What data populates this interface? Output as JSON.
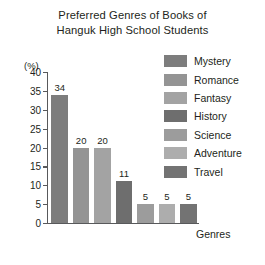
{
  "chart_data": {
    "type": "bar",
    "title": "Preferred Genres of Books of Hanguk High School Students",
    "title_lines": [
      "Preferred Genres of Books of",
      "Hanguk High School Students"
    ],
    "categories": [
      "Mystery",
      "Romance",
      "Fantasy",
      "History",
      "Science",
      "Adventure",
      "Travel"
    ],
    "values": [
      34,
      20,
      20,
      11,
      5,
      5,
      5
    ],
    "xlabel": "Genres",
    "ylabel": "(%)",
    "ylim": [
      0,
      40
    ],
    "ytick_labels": [
      "40",
      "35",
      "30",
      "25",
      "20",
      "15",
      "10",
      "5",
      "0"
    ],
    "ytick_values": [
      40,
      35,
      30,
      25,
      20,
      15,
      10,
      5,
      0
    ],
    "ytick_step": 5,
    "grid": false,
    "legend_position": "right",
    "legend": [
      {
        "label": "Mystery",
        "color": "#7d7d7d"
      },
      {
        "label": "Romance",
        "color": "#949494"
      },
      {
        "label": "Fantasy",
        "color": "#a3a3a3"
      },
      {
        "label": "History",
        "color": "#6e6e6e"
      },
      {
        "label": "Science",
        "color": "#9c9c9c"
      },
      {
        "label": "Adventure",
        "color": "#adadad"
      },
      {
        "label": "Travel",
        "color": "#737373"
      }
    ],
    "bar_colors": [
      "#7d7d7d",
      "#949494",
      "#a3a3a3",
      "#6e6e6e",
      "#9c9c9c",
      "#adadad",
      "#737373"
    ],
    "axis_color": "#58595b",
    "background_color": "#ffffff"
  }
}
